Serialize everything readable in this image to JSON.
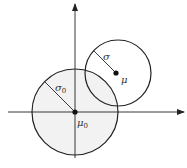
{
  "diagram": {
    "labels": {
      "sigma": "σ",
      "mu": "μ",
      "sigma0_base": "σ",
      "sigma0_sub": "0",
      "mu0_base": "μ",
      "mu0_sub": "0"
    },
    "colors": {
      "stroke": "#222222",
      "fill_large": "#f2f2f2",
      "fill_small": "#ffffff"
    },
    "geometry": {
      "origin": [
        75,
        112
      ],
      "large_circle": {
        "cx": 75,
        "cy": 112,
        "r": 43
      },
      "small_circle": {
        "cx": 116,
        "cy": 73,
        "r": 33
      }
    }
  }
}
